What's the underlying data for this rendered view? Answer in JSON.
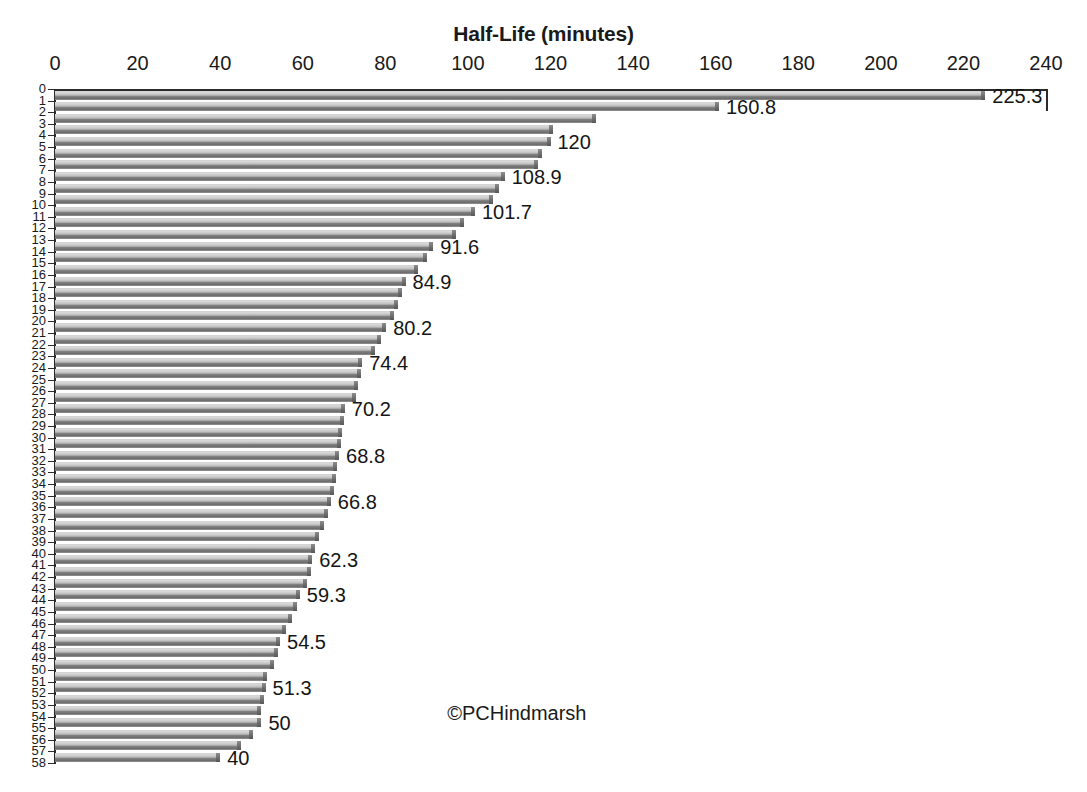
{
  "chart_data": {
    "type": "bar",
    "orientation": "horizontal",
    "title": "Half-Life (minutes)",
    "xlabel": "Half-Life (minutes)",
    "ylabel": "",
    "xlim": [
      0,
      240
    ],
    "ylim": [
      0,
      58
    ],
    "grid": false,
    "legend": null,
    "legend_position": "none",
    "x_ticks": [
      0,
      20,
      40,
      60,
      80,
      100,
      120,
      140,
      160,
      180,
      200,
      220,
      240
    ],
    "x_tick_labels": [
      "0",
      "20",
      "40",
      "60",
      "80",
      "100",
      "120",
      "140",
      "160",
      "180",
      "200",
      "220",
      "240"
    ],
    "y_ticks": [
      0,
      1,
      2,
      3,
      4,
      5,
      6,
      7,
      8,
      9,
      10,
      11,
      12,
      13,
      14,
      15,
      16,
      17,
      18,
      19,
      20,
      21,
      22,
      23,
      24,
      25,
      26,
      27,
      28,
      29,
      30,
      31,
      32,
      33,
      34,
      35,
      36,
      37,
      38,
      39,
      40,
      41,
      42,
      43,
      44,
      45,
      46,
      47,
      48,
      49,
      50,
      51,
      52,
      53,
      54,
      55,
      56,
      57,
      58
    ],
    "y_tick_labels": [
      "0",
      "1",
      "2",
      "3",
      "4",
      "5",
      "6",
      "7",
      "8",
      "9",
      "10",
      "11",
      "12",
      "13",
      "14",
      "15",
      "16",
      "17",
      "18",
      "19",
      "20",
      "21",
      "22",
      "23",
      "24",
      "25",
      "26",
      "27",
      "28",
      "29",
      "30",
      "31",
      "32",
      "33",
      "34",
      "35",
      "36",
      "37",
      "38",
      "39",
      "40",
      "41",
      "42",
      "43",
      "44",
      "45",
      "46",
      "47",
      "48",
      "49",
      "50",
      "51",
      "52",
      "53",
      "54",
      "55",
      "56",
      "57",
      "58"
    ],
    "categories": [
      "1",
      "2",
      "3",
      "4",
      "5",
      "6",
      "7",
      "8",
      "9",
      "10",
      "11",
      "12",
      "13",
      "14",
      "15",
      "16",
      "17",
      "18",
      "19",
      "20",
      "21",
      "22",
      "23",
      "24",
      "25",
      "26",
      "27",
      "28",
      "29",
      "30",
      "31",
      "32",
      "33",
      "34",
      "35",
      "36",
      "37",
      "38",
      "39",
      "40",
      "41",
      "42",
      "43",
      "44",
      "45",
      "46",
      "47",
      "48",
      "49",
      "50",
      "51",
      "52",
      "53",
      "54",
      "55",
      "56",
      "57",
      "58"
    ],
    "values": [
      225.3,
      160.8,
      131.0,
      120.6,
      120.0,
      118.0,
      117.0,
      108.9,
      107.5,
      106.0,
      101.7,
      99.0,
      97.0,
      91.6,
      90.0,
      88.0,
      84.9,
      84.0,
      83.0,
      82.0,
      80.2,
      79.0,
      77.5,
      74.4,
      74.0,
      73.5,
      73.0,
      70.2,
      70.0,
      69.6,
      69.2,
      68.8,
      68.4,
      68.0,
      67.5,
      66.8,
      66.0,
      65.2,
      64.0,
      63.0,
      62.3,
      62.0,
      61.0,
      59.3,
      58.5,
      57.5,
      56.0,
      54.5,
      54.0,
      53.0,
      51.3,
      51.0,
      50.5,
      50.0,
      50.0,
      48.0,
      45.0,
      40.0
    ],
    "data_labels": [
      {
        "index": 1,
        "value": 225.3,
        "text": "225.3"
      },
      {
        "index": 2,
        "value": 160.8,
        "text": "160.8"
      },
      {
        "index": 5,
        "value": 120.0,
        "text": "120"
      },
      {
        "index": 8,
        "value": 108.9,
        "text": "108.9"
      },
      {
        "index": 11,
        "value": 101.7,
        "text": "101.7"
      },
      {
        "index": 14,
        "value": 91.6,
        "text": "91.6"
      },
      {
        "index": 17,
        "value": 84.9,
        "text": "84.9"
      },
      {
        "index": 21,
        "value": 80.2,
        "text": "80.2"
      },
      {
        "index": 24,
        "value": 74.4,
        "text": "74.4"
      },
      {
        "index": 28,
        "value": 70.2,
        "text": "70.2"
      },
      {
        "index": 32,
        "value": 68.8,
        "text": "68.8"
      },
      {
        "index": 36,
        "value": 66.8,
        "text": "66.8"
      },
      {
        "index": 41,
        "value": 62.3,
        "text": "62.3"
      },
      {
        "index": 44,
        "value": 59.3,
        "text": "59.3"
      },
      {
        "index": 48,
        "value": 54.5,
        "text": "54.5"
      },
      {
        "index": 52,
        "value": 51.3,
        "text": "51.3"
      },
      {
        "index": 55,
        "value": 50.0,
        "text": "50"
      },
      {
        "index": 58,
        "value": 40.0,
        "text": "40"
      }
    ],
    "annotations": [
      {
        "name": "copyright-watermark",
        "text": "©PCHindmarsh",
        "x": 95,
        "y_row": 54
      }
    ],
    "colors": {
      "bar_light": "#d6d6d6",
      "bar_dark": "#6d6d6d",
      "axis": "#2b2b2b",
      "text": "#1a1a1a",
      "background": "#ffffff"
    }
  }
}
